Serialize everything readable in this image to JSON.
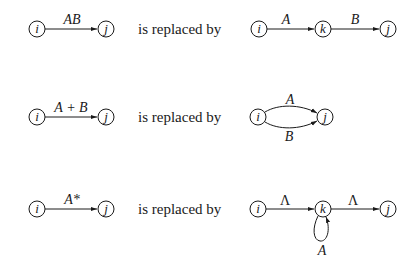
{
  "figure": {
    "replaced_by_text": "is replaced by"
  },
  "rules": [
    {
      "id": "concatenation",
      "left": {
        "nodes": [
          {
            "id": "i",
            "label": "i"
          },
          {
            "id": "j",
            "label": "j"
          }
        ],
        "edges": [
          {
            "from": "i",
            "to": "j",
            "label": "AB"
          }
        ]
      },
      "right": {
        "nodes": [
          {
            "id": "i",
            "label": "i"
          },
          {
            "id": "k",
            "label": "k"
          },
          {
            "id": "j",
            "label": "j"
          }
        ],
        "edges": [
          {
            "from": "i",
            "to": "k",
            "label": "A"
          },
          {
            "from": "k",
            "to": "j",
            "label": "B"
          }
        ]
      }
    },
    {
      "id": "union",
      "left": {
        "nodes": [
          {
            "id": "i",
            "label": "i"
          },
          {
            "id": "j",
            "label": "j"
          }
        ],
        "edges": [
          {
            "from": "i",
            "to": "j",
            "label": "A + B"
          }
        ]
      },
      "right": {
        "nodes": [
          {
            "id": "i",
            "label": "i"
          },
          {
            "id": "j",
            "label": "j"
          }
        ],
        "edges": [
          {
            "from": "i",
            "to": "j",
            "label": "A",
            "curve": "upper"
          },
          {
            "from": "i",
            "to": "j",
            "label": "B",
            "curve": "lower"
          }
        ]
      }
    },
    {
      "id": "closure",
      "left": {
        "nodes": [
          {
            "id": "i",
            "label": "i"
          },
          {
            "id": "j",
            "label": "j"
          }
        ],
        "edges": [
          {
            "from": "i",
            "to": "j",
            "label": "A*"
          }
        ]
      },
      "right": {
        "nodes": [
          {
            "id": "i",
            "label": "i"
          },
          {
            "id": "k",
            "label": "k"
          },
          {
            "id": "j",
            "label": "j"
          }
        ],
        "edges": [
          {
            "from": "i",
            "to": "k",
            "label": "Λ"
          },
          {
            "from": "k",
            "to": "j",
            "label": "Λ"
          },
          {
            "from": "k",
            "to": "k",
            "label": "A",
            "loop": "below"
          }
        ]
      }
    }
  ]
}
